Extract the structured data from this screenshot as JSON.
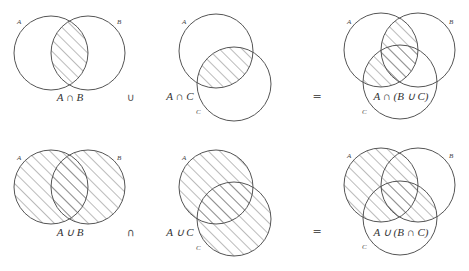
{
  "colors": {
    "stroke": "#555555",
    "background": "#ffffff",
    "text": "#333333"
  },
  "rows": [
    {
      "panels": [
        {
          "circles": {
            "A": {
              "cx": 51,
              "cy": 53,
              "r": 37
            },
            "B": {
              "cx": 88,
              "cy": 53,
              "r": 37
            }
          },
          "set_labels": {
            "A": "A",
            "B": "B"
          },
          "expression": "A ∩ B",
          "shaded_region": "A∩B"
        },
        {
          "circles": {
            "A": {
              "cx": 216,
              "cy": 51,
              "r": 37
            },
            "C": {
              "cx": 234,
              "cy": 84,
              "r": 37
            }
          },
          "set_labels": {
            "A": "A",
            "C": "C"
          },
          "expression": "A ∩ C",
          "shaded_region": "A∩C"
        },
        {
          "circles": {
            "A": {
              "cx": 381,
              "cy": 50,
              "r": 37
            },
            "B": {
              "cx": 418,
              "cy": 50,
              "r": 37
            },
            "C": {
              "cx": 400,
              "cy": 82,
              "r": 37
            }
          },
          "set_labels": {
            "A": "A",
            "B": "B",
            "C": "C"
          },
          "expression": "A ∩ (B ∪ C)",
          "shaded_region": "A∩(B∪C)"
        }
      ],
      "operator": "∪",
      "equals": "="
    },
    {
      "panels": [
        {
          "circles": {
            "A": {
              "cx": 51,
              "cy": 187,
              "r": 37
            },
            "B": {
              "cx": 88,
              "cy": 187,
              "r": 37
            }
          },
          "set_labels": {
            "A": "A",
            "B": "B"
          },
          "expression": "A ∪ B",
          "shaded_region": "A∪B"
        },
        {
          "circles": {
            "A": {
              "cx": 216,
              "cy": 187,
              "r": 37
            },
            "C": {
              "cx": 234,
              "cy": 219,
              "r": 37
            }
          },
          "set_labels": {
            "A": "A",
            "C": "C"
          },
          "expression": "A ∪ C",
          "shaded_region": "A∪C"
        },
        {
          "circles": {
            "A": {
              "cx": 381,
              "cy": 185,
              "r": 37
            },
            "B": {
              "cx": 418,
              "cy": 185,
              "r": 37
            },
            "C": {
              "cx": 400,
              "cy": 218,
              "r": 37
            }
          },
          "set_labels": {
            "A": "A",
            "B": "B",
            "C": "C"
          },
          "expression": "A ∪ (B ∩ C)",
          "shaded_region": "A∪(B∩C)"
        }
      ],
      "operator": "∩",
      "equals": "="
    }
  ]
}
